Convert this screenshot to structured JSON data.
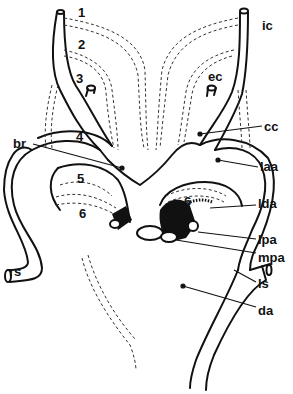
{
  "diagram": {
    "colors": {
      "stroke": "#111111",
      "background": "#ffffff",
      "fill_dark": "#111111"
    },
    "arch_numbers": [
      "1",
      "2",
      "3",
      "4",
      "5",
      "6",
      "6"
    ],
    "labels": {
      "ic": "ic",
      "ec": "ec",
      "cc": "cc",
      "br": "br",
      "laa": "laa",
      "lda": "lda",
      "lpa": "lpa",
      "mpa": "mpa",
      "rs": "rs",
      "ls": "ls",
      "da": "da"
    }
  }
}
